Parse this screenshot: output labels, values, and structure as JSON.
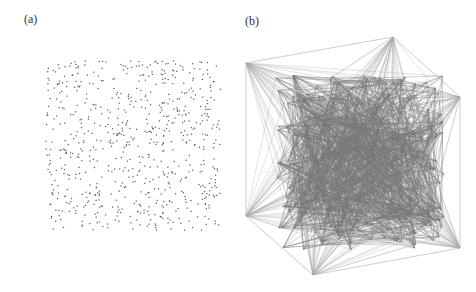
{
  "panels": [
    {
      "label": "(a)",
      "description": "Random 3D point cloud (scatter of vertices)",
      "point_count": 700
    },
    {
      "label": "(b)",
      "description": "Graph with edges connecting points, outer hull vertices",
      "hull_vertices": [
        [
          246,
          63
        ],
        [
          393,
          37
        ],
        [
          460,
          97
        ],
        [
          460,
          248
        ],
        [
          313,
          275
        ],
        [
          246,
          216
        ]
      ]
    }
  ],
  "colors": {
    "points": "#555555",
    "edges": "#777777",
    "hull": "#aaaaaa"
  }
}
